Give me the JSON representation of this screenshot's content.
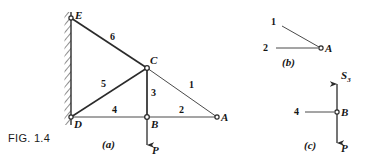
{
  "figure": {
    "caption": "FIG. 1.4",
    "subfigures": [
      {
        "key": "a",
        "label": "(a)"
      },
      {
        "key": "b",
        "label": "(b)"
      },
      {
        "key": "c",
        "label": "(c)"
      }
    ]
  },
  "colors": {
    "line": "#2b2b2b",
    "thin_line": "#555555",
    "text": "#151515",
    "background": "#ffffff",
    "wall_hatch": "#333333"
  },
  "panel_a": {
    "name": "truss-diagram",
    "joints": [
      {
        "id": "E",
        "label": "E",
        "x": 71,
        "y": 18
      },
      {
        "id": "C",
        "label": "C",
        "x": 147,
        "y": 68
      },
      {
        "id": "D",
        "label": "D",
        "x": 71,
        "y": 117
      },
      {
        "id": "B",
        "label": "B",
        "x": 147,
        "y": 117
      },
      {
        "id": "A",
        "label": "A",
        "x": 217,
        "y": 117
      }
    ],
    "members": [
      {
        "id": "1",
        "label": "1",
        "from": "C",
        "to": "A",
        "label_x": 192,
        "label_y": 85
      },
      {
        "id": "2",
        "label": "2",
        "from": "B",
        "to": "A",
        "label_x": 182,
        "label_y": 110
      },
      {
        "id": "3",
        "label": "3",
        "from": "C",
        "to": "B",
        "label_x": 153,
        "label_y": 93
      },
      {
        "id": "4",
        "label": "4",
        "from": "D",
        "to": "B",
        "label_x": 115,
        "label_y": 110
      },
      {
        "id": "5",
        "label": "5",
        "from": "D",
        "to": "C",
        "label_x": 104,
        "label_y": 84
      },
      {
        "id": "6",
        "label": "6",
        "from": "E",
        "to": "C",
        "label_x": 113,
        "label_y": 37
      }
    ],
    "wall": {
      "x": 71,
      "y_top": 12,
      "y_bottom": 125
    },
    "load": {
      "label": "P",
      "at_joint": "B",
      "direction": "down",
      "tip_x": 147,
      "tip_y": 152,
      "label_x": 153,
      "label_y": 151
    },
    "caption_x": 108,
    "caption_y": 145
  },
  "panel_b": {
    "name": "joint-a-free-body",
    "joint": {
      "id": "A",
      "label": "A",
      "x": 321,
      "y": 48
    },
    "forces": [
      {
        "id": "1",
        "label": "1",
        "label_x": 274,
        "label_y": 22,
        "tail_x": 282,
        "tail_y": 26
      },
      {
        "id": "2",
        "label": "2",
        "label_x": 266,
        "label_y": 48,
        "tail_x": 276,
        "tail_y": 48
      }
    ],
    "caption_x": 288,
    "caption_y": 64
  },
  "panel_c": {
    "name": "joint-b-free-body",
    "joint": {
      "id": "B",
      "label": "B",
      "x": 337,
      "y": 112
    },
    "forces": [
      {
        "id": "S3",
        "label": "S",
        "subscript": "3",
        "direction": "up",
        "tip_x": 337,
        "tip_y": 79,
        "label_x": 343,
        "label_y": 76
      },
      {
        "id": "P",
        "label": "P",
        "direction": "down",
        "tip_x": 337,
        "tip_y": 150,
        "label_x": 343,
        "label_y": 149
      },
      {
        "id": "4",
        "label": "4",
        "direction": "left",
        "label_x": 297,
        "label_y": 112,
        "tail_x": 305,
        "tail_y": 112
      }
    ],
    "caption_x": 310,
    "caption_y": 146
  }
}
